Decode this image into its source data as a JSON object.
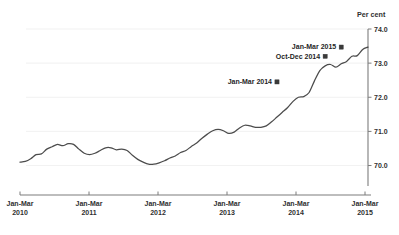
{
  "chart_data": {
    "type": "line",
    "title": "",
    "ylabel": "Per cent",
    "xlabel": "",
    "ylim": [
      69.4,
      74.0
    ],
    "yticks": [
      70.0,
      71.0,
      72.0,
      73.0,
      74.0
    ],
    "ytick_labels": [
      "70.0",
      "71.0",
      "72.0",
      "73.0",
      "74.0"
    ],
    "grid": true,
    "grid_axis": "y",
    "legend": "none",
    "y_axis_position": "right",
    "xtick_labels": [
      "Jan-Mar\n2010",
      "Jan-Mar\n2011",
      "Jan-Mar\n2012",
      "Jan-Mar\n2013",
      "Jan-Mar\n2014",
      "Jan-Mar\n2015"
    ],
    "xticks": [
      {
        "line1": "Jan-Mar",
        "line2": "2010"
      },
      {
        "line1": "Jan-Mar",
        "line2": "2011"
      },
      {
        "line1": "Jan-Mar",
        "line2": "2012"
      },
      {
        "line1": "Jan-Mar",
        "line2": "2013"
      },
      {
        "line1": "Jan-Mar",
        "line2": "2014"
      },
      {
        "line1": "Jan-Mar",
        "line2": "2015"
      }
    ],
    "x": [
      "Jan-Mar 2010",
      "Feb-Apr 2010",
      "Mar-May 2010",
      "Apr-Jun 2010",
      "May-Jul 2010",
      "Jun-Aug 2010",
      "Jul-Sep 2010",
      "Aug-Oct 2010",
      "Sep-Nov 2010",
      "Oct-Dec 2010",
      "Nov-Jan 2011",
      "Dec-Feb 2011",
      "Jan-Mar 2011",
      "Feb-Apr 2011",
      "Mar-May 2011",
      "Apr-Jun 2011",
      "May-Jul 2011",
      "Jun-Aug 2011",
      "Jul-Sep 2011",
      "Aug-Oct 2011",
      "Sep-Nov 2011",
      "Oct-Dec 2011",
      "Nov-Jan 2012",
      "Dec-Feb 2012",
      "Jan-Mar 2012",
      "Feb-Apr 2012",
      "Mar-May 2012",
      "Apr-Jun 2012",
      "May-Jul 2012",
      "Jun-Aug 2012",
      "Jul-Sep 2012",
      "Aug-Oct 2012",
      "Sep-Nov 2012",
      "Oct-Dec 2012",
      "Nov-Jan 2013",
      "Dec-Feb 2013",
      "Jan-Mar 2013",
      "Feb-Apr 2013",
      "Mar-May 2013",
      "Apr-Jun 2013",
      "May-Jul 2013",
      "Jun-Aug 2013",
      "Jul-Sep 2013",
      "Aug-Oct 2013",
      "Sep-Nov 2013",
      "Oct-Dec 2013",
      "Nov-Jan 2014",
      "Dec-Feb 2014",
      "Jan-Mar 2014",
      "Feb-Apr 2014",
      "Mar-May 2014",
      "Apr-Jun 2014",
      "May-Jul 2014",
      "Jun-Aug 2014",
      "Jul-Sep 2014",
      "Aug-Oct 2014",
      "Sep-Nov 2014",
      "Oct-Dec 2014",
      "Nov-Jan 2015",
      "Dec-Feb 2015",
      "Jan-Mar 2015"
    ],
    "values": [
      70.1,
      70.12,
      70.2,
      70.32,
      70.34,
      70.48,
      70.55,
      70.62,
      70.58,
      70.64,
      70.62,
      70.48,
      70.36,
      70.32,
      70.36,
      70.44,
      70.52,
      70.52,
      70.46,
      70.48,
      70.44,
      70.3,
      70.18,
      70.1,
      70.04,
      70.04,
      70.08,
      70.14,
      70.22,
      70.28,
      70.38,
      70.44,
      70.56,
      70.66,
      70.8,
      70.92,
      71.02,
      71.06,
      71.02,
      70.94,
      70.98,
      71.1,
      71.18,
      71.16,
      71.12,
      71.12,
      71.16,
      71.28,
      71.42,
      71.56,
      71.7,
      71.88,
      72.0,
      72.02,
      72.14,
      72.48,
      72.78,
      72.92,
      72.96,
      72.88,
      72.98
    ],
    "series_values_tail": [
      73.05,
      73.2,
      73.22,
      73.4,
      73.47
    ],
    "annotations": [
      {
        "label": "Jan-Mar 2014",
        "x_index": 48,
        "value": 72.45
      },
      {
        "label": "Oct-Dec 2014",
        "x_index": 57,
        "value": 73.2
      },
      {
        "label": "Jan-Mar 2015",
        "x_index": 60,
        "value": 73.47
      }
    ]
  },
  "chart": {
    "y_axis_title": "Per cent"
  }
}
